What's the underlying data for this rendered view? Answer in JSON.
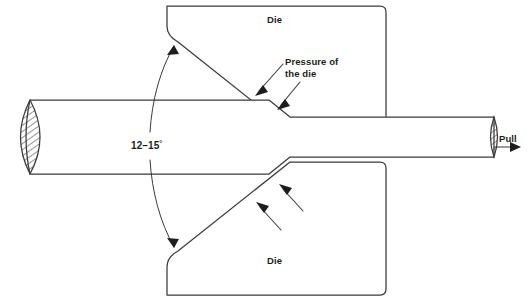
{
  "figure": {
    "width": 527,
    "height": 301,
    "background_color": "#ffffff",
    "line_color": "#3a3a3f",
    "text_color": "#1d1d20"
  },
  "labels": {
    "die_top": "Die",
    "die_bottom": "Die",
    "pressure": "Pressure of\nthe die",
    "angle_value": "12–15",
    "angle_unit": "°",
    "pull": "Pull"
  },
  "parts": {
    "upper_die_name": "upper-die-block",
    "lower_die_name": "lower-die-block",
    "workpiece_name": "workpiece-rod",
    "entry_section_name": "rod-entry-cross-section",
    "exit_section_name": "rod-exit-cross-section",
    "pull_arrow_name": "pull-direction-arrow",
    "angle_arc_name": "die-angle-arc"
  },
  "annotations": {
    "pressure_arrows": 2,
    "die_force_arrows": 2,
    "angle_arrows": 2
  }
}
